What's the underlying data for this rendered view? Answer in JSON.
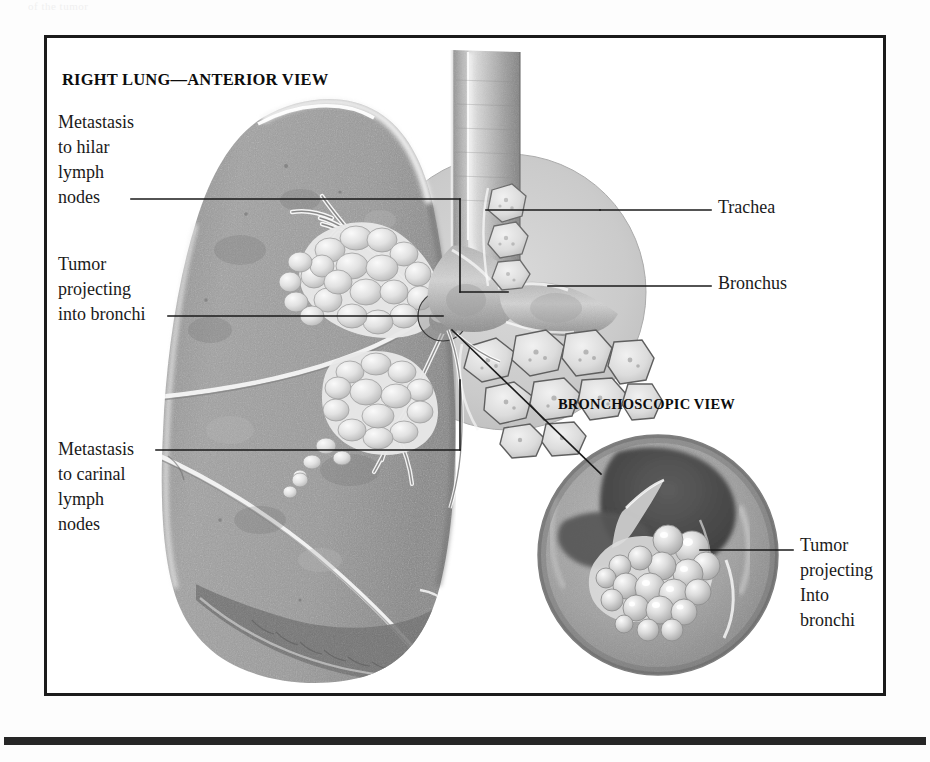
{
  "page": {
    "top_remnant_text": "of the tumor",
    "background_color": "#ffffff",
    "rule_color": "#262626",
    "border_color": "#1b1b1b"
  },
  "figure": {
    "headings": {
      "main": "RIGHT LUNG—ANTERIOR VIEW",
      "inset": "BRONCHOSCOPIC VIEW"
    },
    "labels": {
      "hilar_nodes": "Metastasis\nto hilar\nlymph\nnodes",
      "tumor_left": "Tumor\nprojecting\ninto bronchi",
      "carinal_nodes": "Metastasis\nto carinal\nlymph\nnodes",
      "trachea": "Trachea",
      "bronchus": "Bronchus",
      "tumor_inset": "Tumor\nprojecting\nInto\nbronchi"
    },
    "anatomy": {
      "lung_tone": "#9c9c9c",
      "lung_shadow": "#6f6f6f",
      "lung_highlight": "#f2f2f2",
      "tumor_tone": "#e9e9e9",
      "airway_tone": "#bdbdbd",
      "node_tone": "#dedede",
      "magnifier_tone": "#c9c9c9",
      "scope_dark": "#4a4a4a",
      "parts": [
        "trachea",
        "bronchus",
        "carina",
        "hilar-lymph-nodes",
        "carinal-lymph-nodes",
        "tumor-mass",
        "bronchial-tree",
        "upper-lobe",
        "middle-lobe",
        "lower-lobe",
        "oblique-fissure",
        "horizontal-fissure",
        "diaphragmatic-surface"
      ]
    }
  }
}
